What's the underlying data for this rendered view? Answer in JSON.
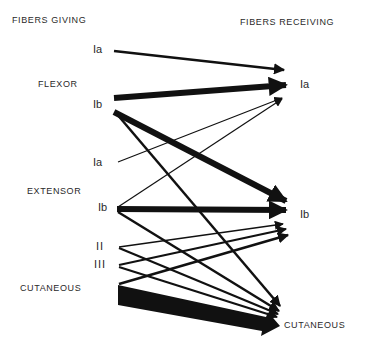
{
  "headers": {
    "giving": "FIBERS GIVING",
    "receiving": "FIBERS RECEIVING"
  },
  "groups_giving": {
    "flexor": "FLEXOR",
    "extensor": "EXTENSOR",
    "cutaneous": "CUTANEOUS"
  },
  "fibers_giving": {
    "flexor_ia": "Ia",
    "flexor_ib": "Ib",
    "extensor_ia": "Ia",
    "extensor_ib": "Ib",
    "cut_ii": "II",
    "cut_iii": "III"
  },
  "fibers_receiving": {
    "ia": "Ia",
    "ib": "Ib",
    "cutaneous": "CUTANEOUS"
  },
  "colors": {
    "stroke": "#111111",
    "background": "#ffffff"
  },
  "connections": [
    {
      "from": "Flexor Ia",
      "to": "Ia",
      "weight": "medium"
    },
    {
      "from": "Flexor Ib",
      "to": "Ia",
      "weight": "heavy"
    },
    {
      "from": "Flexor Ib",
      "to": "Ib",
      "weight": "heavy"
    },
    {
      "from": "Flexor Ib",
      "to": "Cutaneous",
      "weight": "medium"
    },
    {
      "from": "Extensor Ia",
      "to": "Ia",
      "weight": "thin"
    },
    {
      "from": "Extensor Ib",
      "to": "Ia",
      "weight": "thin"
    },
    {
      "from": "Extensor Ib",
      "to": "Ib",
      "weight": "heavy"
    },
    {
      "from": "Extensor Ib",
      "to": "Cutaneous",
      "weight": "medium"
    },
    {
      "from": "II",
      "to": "Ib",
      "weight": "thin"
    },
    {
      "from": "II",
      "to": "Cutaneous",
      "weight": "medium"
    },
    {
      "from": "III",
      "to": "Ib",
      "weight": "medium"
    },
    {
      "from": "III",
      "to": "Cutaneous",
      "weight": "medium"
    },
    {
      "from": "Cutaneous",
      "to": "Ib",
      "weight": "medium"
    },
    {
      "from": "Cutaneous",
      "to": "Cutaneous",
      "weight": "very-heavy"
    }
  ]
}
